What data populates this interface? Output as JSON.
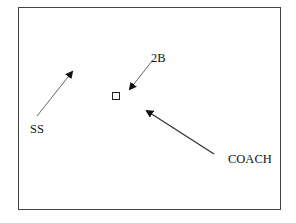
{
  "diagram": {
    "labels": {
      "second_base": "2B",
      "shortstop": "SS",
      "coach": "COACH"
    },
    "markers": {
      "base": "square-marker"
    },
    "arrows": [
      {
        "name": "ss-arrow",
        "from": [
          37,
          116
        ],
        "to": [
          74,
          70
        ]
      },
      {
        "name": "2b-arrow",
        "from": [
          152,
          61
        ],
        "to": [
          128,
          92
        ]
      },
      {
        "name": "coach-arrow",
        "from": [
          214,
          154
        ],
        "to": [
          144,
          109
        ]
      }
    ],
    "colors": {
      "line": "#555555",
      "border": "#444444",
      "text": "#111111"
    }
  }
}
